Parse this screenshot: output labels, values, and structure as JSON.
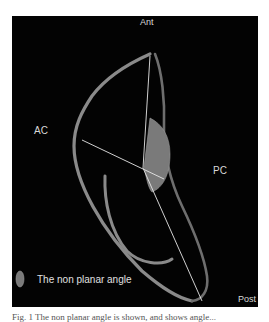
{
  "figure": {
    "labels": {
      "anterior": "Ant",
      "anterior_chamber": "AC",
      "posterior_chamber": "PC",
      "posterior": "Post"
    },
    "legend": {
      "icon": "gray-leaf-swatch-icon",
      "text": "The non planar angle"
    },
    "colors": {
      "background": "#030303",
      "curve": "#8a8a8a",
      "line": "#e6e6e6",
      "angle_fill": "#7a7a7a",
      "label": "#d8d8d8"
    }
  },
  "caption": {
    "text": "Fig. 1  The non planar angle is shown, and shows angle..."
  }
}
